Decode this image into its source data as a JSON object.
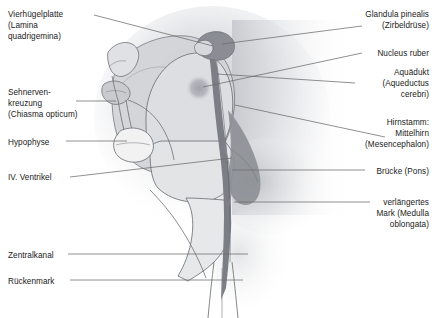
{
  "figure": {
    "kind": "anatomical-diagram",
    "language": "de",
    "width": 435,
    "height": 318,
    "background_color": "#ffffff"
  },
  "palette": {
    "outline": "#5a5a5a",
    "leader_line": "#6b6b6b",
    "text": "#1a1a1a",
    "haze": "#d8dade",
    "cerebrum_fill": "#d2d4d8",
    "brainstem_fill": "#dcdee1",
    "pons_fill": "#e2e4e6",
    "medulla_fill": "#e7e8ea",
    "cerebellum_fill": "#8d9096",
    "aqueduct_fill": "#7b7e84",
    "pineal_fill": "#8a8d93",
    "nucleus_ruber_fill": "#a9acb2",
    "chiasm_fill": "#c9cbcf",
    "hypophysis_fill": "#f2f2f3"
  },
  "labels_left": [
    {
      "id": "vierhuegelplatte",
      "lines": [
        "Vierhügelplatte",
        "(Lamina",
        "quadrigemina)"
      ],
      "x": 8,
      "y": 9,
      "leader": {
        "x1": 94,
        "y1": 15,
        "x2": 213,
        "y2": 46
      }
    },
    {
      "id": "sehnervenkreuzung",
      "lines": [
        "Sehnerven-",
        "kreuzung",
        "(Chiasma opticum)"
      ],
      "x": 8,
      "y": 87,
      "leader": {
        "x1": 76,
        "y1": 101,
        "x2": 116,
        "y2": 101
      }
    },
    {
      "id": "hypophyse",
      "lines": [
        "Hypophyse"
      ],
      "x": 8,
      "y": 137,
      "leader": {
        "x1": 66,
        "y1": 141,
        "x2": 127,
        "y2": 141
      }
    },
    {
      "id": "iv-ventrikel",
      "lines": [
        "IV. Ventrikel"
      ],
      "x": 8,
      "y": 172,
      "leader": {
        "x1": 70,
        "y1": 177,
        "x2": 232,
        "y2": 158
      }
    },
    {
      "id": "zentralkanal",
      "lines": [
        "Zentralkanal"
      ],
      "x": 8,
      "y": 250,
      "leader": {
        "x1": 68,
        "y1": 254,
        "x2": 248,
        "y2": 254
      }
    },
    {
      "id": "rueckenmark",
      "lines": [
        "Rückenmark"
      ],
      "x": 8,
      "y": 276,
      "leader": {
        "x1": 70,
        "y1": 280,
        "x2": 243,
        "y2": 280
      }
    }
  ],
  "labels_right": [
    {
      "id": "glandula-pinealis",
      "lines": [
        "Glandula pinealis",
        "(Zirbeldrüse)"
      ],
      "right": 6,
      "y": 9,
      "leader": {
        "x1": 362,
        "y1": 26,
        "x2": 222,
        "y2": 44
      }
    },
    {
      "id": "nucleus-ruber",
      "lines": [
        "Nucleus ruber"
      ],
      "right": 6,
      "y": 48,
      "leader": {
        "x1": 362,
        "y1": 53,
        "x2": 203,
        "y2": 87
      }
    },
    {
      "id": "aquaedukt",
      "lines": [
        "Aquädukt",
        "(Aqueductus",
        "cerebri)"
      ],
      "right": 6,
      "y": 67,
      "leader": {
        "x1": 355,
        "y1": 83,
        "x2": 217,
        "y2": 74
      }
    },
    {
      "id": "hirnstamm-mittelhirn",
      "lines": [
        "Hirnstamm:",
        "Mittelhirn",
        "(Mesencephalon)"
      ],
      "right": 6,
      "y": 117,
      "leader": {
        "x1": 385,
        "y1": 137,
        "x2": 235,
        "y2": 105
      }
    },
    {
      "id": "bruecke-pons",
      "lines": [
        "Brücke (Pons)"
      ],
      "right": 6,
      "y": 166,
      "leader": {
        "x1": 365,
        "y1": 170,
        "x2": 232,
        "y2": 170
      }
    },
    {
      "id": "verlaengertes-mark",
      "lines": [
        "verlängertes",
        "Mark (Medulla",
        "oblongata)"
      ],
      "right": 6,
      "y": 197,
      "leader": {
        "x1": 370,
        "y1": 202,
        "x2": 234,
        "y2": 202
      }
    }
  ]
}
